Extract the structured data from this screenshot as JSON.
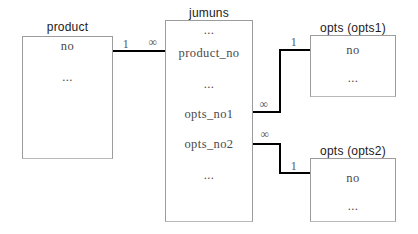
{
  "canvas": {
    "background": "#ffffff",
    "connector_color": "#000000",
    "box_border_color": "#9c9c9c"
  },
  "entities": {
    "product": {
      "title": "product",
      "fields": [
        "no",
        "..."
      ]
    },
    "jumuns": {
      "title": "jumuns",
      "fields": [
        "...",
        "product_no",
        "...",
        "opts_no1",
        "opts_no2",
        "..."
      ]
    },
    "opts1": {
      "title": "opts (opts1)",
      "fields": [
        "no",
        "..."
      ]
    },
    "opts2": {
      "title": "opts (opts2)",
      "fields": [
        "no",
        "..."
      ]
    }
  },
  "relationships": {
    "product_jumuns": {
      "from": "product",
      "to": "jumuns",
      "from_card": "1",
      "to_card": "∞"
    },
    "jumuns_opts1": {
      "from": "jumuns",
      "to": "opts (opts1)",
      "from_card": "∞",
      "to_card": "1"
    },
    "jumuns_opts2": {
      "from": "jumuns",
      "to": "opts (opts2)",
      "from_card": "∞",
      "to_card": "1"
    }
  }
}
